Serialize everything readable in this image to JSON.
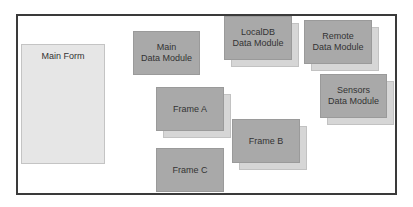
{
  "diagram": {
    "main_form": {
      "label": "Main Form"
    },
    "data_modules": [
      {
        "id": "main",
        "label": "Main\nData Module",
        "stacked": false
      },
      {
        "id": "localdb",
        "label": "LocalDB\nData Module",
        "stacked": true
      },
      {
        "id": "remote",
        "label": "Remote\nData Module",
        "stacked": true
      },
      {
        "id": "sensors",
        "label": "Sensors\nData Module",
        "stacked": true
      }
    ],
    "frames": [
      {
        "id": "a",
        "label": "Frame A",
        "stacked": true
      },
      {
        "id": "b",
        "label": "Frame B",
        "stacked": true
      },
      {
        "id": "c",
        "label": "Frame C",
        "stacked": false
      }
    ],
    "colors": {
      "border": "#3a3a3a",
      "form_fill": "#e6e6e6",
      "module_fill": "#a9a9a9",
      "shadow_fill": "#d6d6d6",
      "text": "#333333"
    }
  }
}
